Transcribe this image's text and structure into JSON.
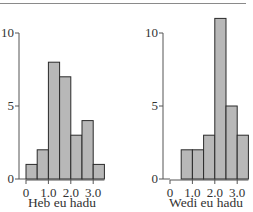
{
  "chart_data": [
    {
      "type": "bar",
      "title": "",
      "xlabel": "Heb eu hadu",
      "ylabel": "",
      "bin_edges": [
        0,
        0.5,
        1.0,
        1.5,
        2.0,
        2.5,
        3.0,
        3.5
      ],
      "categories": [
        "0-0.5",
        "0.5-1.0",
        "1.0-1.5",
        "1.5-2.0",
        "2.0-2.5",
        "2.5-3.0",
        "3.0-3.5"
      ],
      "values": [
        1,
        2,
        8,
        7,
        3,
        4,
        1
      ],
      "ylim": [
        0,
        10
      ],
      "yticks": [
        "0",
        "5",
        "10"
      ],
      "xticks": [
        "0",
        "1.0",
        "2.0",
        "3.0"
      ],
      "grid": false
    },
    {
      "type": "bar",
      "title": "",
      "xlabel": "Wedi eu hadu",
      "ylabel": "",
      "bin_edges": [
        0,
        0.5,
        1.0,
        1.5,
        2.0,
        2.5,
        3.0,
        3.5
      ],
      "categories": [
        "0-0.5",
        "0.5-1.0",
        "1.0-1.5",
        "1.5-2.0",
        "2.0-2.5",
        "2.5-3.0",
        "3.0-3.5"
      ],
      "values": [
        0,
        2,
        2,
        3,
        11,
        5,
        3
      ],
      "ylim": [
        0,
        11
      ],
      "yticks": [
        "0",
        "5",
        "10"
      ],
      "xticks": [
        "0",
        "1.0",
        "2.0",
        "3.0"
      ],
      "grid": false
    }
  ],
  "colors": {
    "bar_fill": "#b8b8b8",
    "bar_edge": "#2a2a2a",
    "axis": "#555555",
    "text": "#333333"
  }
}
